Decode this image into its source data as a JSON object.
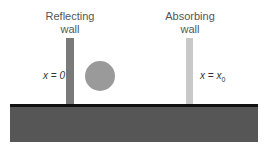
{
  "diagram": {
    "reflecting_wall": {
      "title_line1": "Reflecting",
      "title_line2": "wall",
      "position_label": "x = 0",
      "color": "#7a7a7a"
    },
    "absorbing_wall": {
      "title_line1": "Absorbing",
      "title_line2": "wall",
      "position_label_var": "x = x",
      "position_label_sub": "0",
      "color": "#c8c8c8"
    },
    "particle": {
      "color": "#9a9a9a"
    },
    "ground": {
      "surface_color": "#111111",
      "fill_color": "#565656"
    }
  }
}
